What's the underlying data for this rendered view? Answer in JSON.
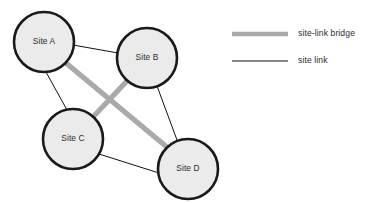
{
  "diagram": {
    "canvas": {
      "width": 368,
      "height": 203,
      "background": "#ffffff"
    },
    "colors": {
      "node_fill": "#ebebeb",
      "node_stroke": "#1a1a1a",
      "site_link": "#111111",
      "site_link_bridge": "#a9a9a9",
      "label_text": "#2b2b2b"
    },
    "nodes": [
      {
        "id": "A",
        "label": "Site A",
        "cx": 44,
        "cy": 42,
        "r": 30
      },
      {
        "id": "B",
        "label": "Site B",
        "cx": 147,
        "cy": 58,
        "r": 30
      },
      {
        "id": "C",
        "label": "Site C",
        "cx": 73,
        "cy": 139,
        "r": 30
      },
      {
        "id": "D",
        "label": "Site D",
        "cx": 188,
        "cy": 169,
        "r": 30
      }
    ],
    "edges": [
      {
        "id": "a-b",
        "type": "site-link",
        "from": "A",
        "to": "B",
        "x1": 73,
        "y1": 45,
        "x2": 118,
        "y2": 53
      },
      {
        "id": "a-c",
        "type": "site-link",
        "from": "A",
        "to": "C",
        "x1": 46,
        "y1": 72,
        "x2": 67,
        "y2": 110
      },
      {
        "id": "b-d",
        "type": "site-link",
        "from": "B",
        "to": "D",
        "x1": 157,
        "y1": 86,
        "x2": 177,
        "y2": 140
      },
      {
        "id": "c-d",
        "type": "site-link",
        "from": "C",
        "to": "D",
        "x1": 99,
        "y1": 154,
        "x2": 159,
        "y2": 173
      },
      {
        "id": "a-d",
        "type": "site-link-bridge",
        "from": "A",
        "to": "D",
        "x1": 66,
        "y1": 63,
        "x2": 168,
        "y2": 148
      },
      {
        "id": "b-c",
        "type": "site-link-bridge",
        "from": "B",
        "to": "C",
        "x1": 127,
        "y1": 81,
        "x2": 92,
        "y2": 118
      }
    ]
  },
  "legend": {
    "items": [
      {
        "id": "site-link-bridge",
        "label": "site-link bridge",
        "swatch": "thick-gray-line",
        "swatch_x1": 232,
        "swatch_x2": 288,
        "swatch_y": 34,
        "label_x": 298,
        "label_y": 34
      },
      {
        "id": "site-link",
        "label": "site link",
        "swatch": "thin-black-line",
        "swatch_x1": 232,
        "swatch_x2": 288,
        "swatch_y": 61,
        "label_x": 298,
        "label_y": 61
      }
    ]
  }
}
